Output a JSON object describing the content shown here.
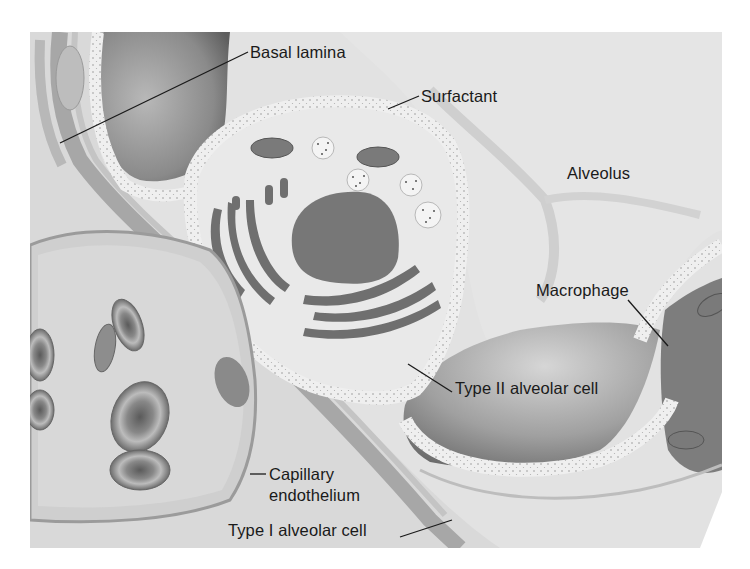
{
  "figure": {
    "colors": {
      "background": "#ffffff",
      "paper": "#e6e6e6",
      "alveolar_space": "#dedede",
      "alveolar_shadow": "#7f7f7f",
      "cell_cytoplasm": "#e9e9e9",
      "surfactant_layer": "#f1f1f1",
      "nucleus": "#777777",
      "organelle_dark": "#6f6f6f",
      "membrane": "#a9a9a9",
      "label_text": "#1a1a1a",
      "leader_line": "#1a1a1a"
    }
  },
  "labels": [
    {
      "id": "basal-lamina",
      "text": "Basal lamina"
    },
    {
      "id": "surfactant",
      "text": "Surfactant"
    },
    {
      "id": "alveolus",
      "text": "Alveolus"
    },
    {
      "id": "macrophage",
      "text": "Macrophage"
    },
    {
      "id": "type-ii-alveolar-cell",
      "text": "Type II alveolar cell"
    },
    {
      "id": "capillary-endothelium",
      "text": "Capillary",
      "text2": "endothelium"
    },
    {
      "id": "type-i-alveolar-cell",
      "text": "Type I alveolar cell"
    }
  ]
}
